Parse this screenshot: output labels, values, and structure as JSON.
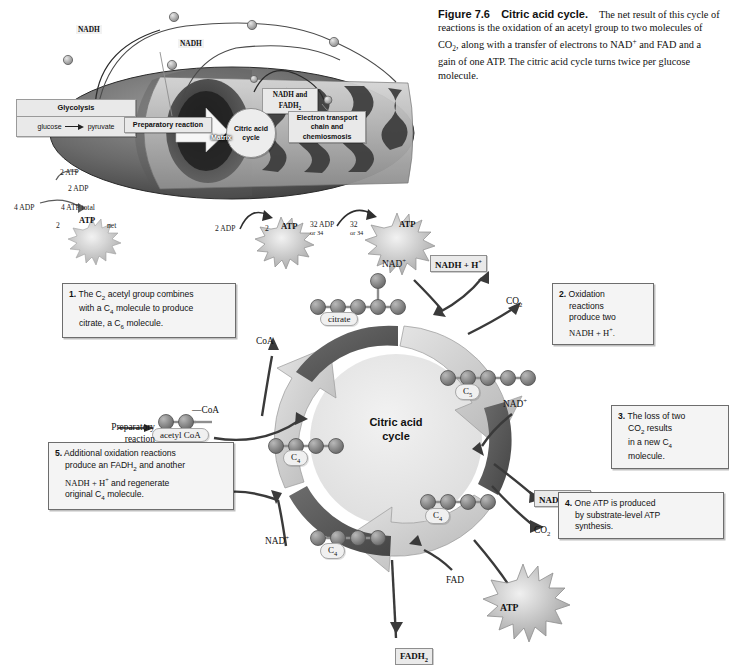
{
  "caption": {
    "figure_number": "Figure 7.6",
    "figure_title": "Citric acid cycle.",
    "body_line1": "The net result of this cycle of",
    "body_line2": "reactions is the oxidation of an acetyl group to two molecules of CO",
    "body_line2_sub": "2",
    "body_line2_end": ",",
    "body_line3a": "along with a transfer of electrons to NAD",
    "body_line3_sup": "+",
    "body_line3b": " and FAD and a gain of one",
    "body_line4": "ATP. The citric acid cycle turns twice per glucose molecule."
  },
  "overview": {
    "glycolysis_title": "Glycolysis",
    "glycolysis_from": "glucose",
    "glycolysis_to": "pyruvate",
    "preparatory_reaction": "Preparatory reaction",
    "citric_acid_cycle": "Citric acid cycle",
    "electron_transport": "Electron transport chain and chemiosmosis",
    "nadh_fadh2_line1": "NADH and",
    "nadh_fadh2_line2": "FADH",
    "nadh_fadh2_sub": "2",
    "matrix": "Matrix",
    "nadh_left": "NADH",
    "nadh_mid": "NADH",
    "atp_2atp": "2 ATP",
    "atp_2adp": "2 ADP",
    "atp_4adp": "4 ADP",
    "atp_4total": "4 ATP total",
    "atp_2": "2",
    "atp_burst": "ATP",
    "atp_net": "net",
    "cac_2adp": "2 ADP",
    "cac_2": "2",
    "cac_atp": "ATP",
    "etc_32adp_l1": "32 ADP",
    "etc_32adp_l2": "or 34",
    "etc_32_l1": "32",
    "etc_32_l2": "or 34",
    "etc_atp": "ATP"
  },
  "cycle": {
    "center_line1": "Citric acid",
    "center_line2": "cycle",
    "preparatory_line1": "Preparatory",
    "preparatory_line2": "reaction",
    "acetyl_coa": "acetyl CoA",
    "coa_bond_label": "CoA",
    "coa_released": "CoA",
    "citrate": "citrate",
    "c5": "C",
    "c5_sub": "5",
    "c4_right": "C",
    "c4_right_sub": "4",
    "c4_bottom": "C",
    "c4_bottom_sub": "4",
    "c4_left": "C",
    "c4_left_sub": "4",
    "nad_top": "NAD",
    "nad_top_sup": "+",
    "nad_right": "NAD",
    "nad_right_sup": "+",
    "nad_bottom": "NAD",
    "nad_bottom_sup": "+",
    "nadh_top": "NADH + H",
    "nadh_top_sup": "+",
    "nadh_right": "NADH + H",
    "nadh_right_sup": "+",
    "nadh_left": "NADH + H",
    "nadh_left_sup": "+",
    "co2_top": "CO",
    "co2_top_sub": "2",
    "co2_right": "CO",
    "co2_right_sub": "2",
    "fad": "FAD",
    "fadh2": "FADH",
    "fadh2_sub": "2",
    "atp": "ATP"
  },
  "steps": [
    {
      "number": "1.",
      "line1_a": "The C",
      "line1_sub": "2",
      "line1_b": " acetyl group combines",
      "line2_a": "with a C",
      "line2_sub": "4",
      "line2_b": " molecule to produce",
      "line3_a": "citrate, a C",
      "line3_sub": "6",
      "line3_b": " molecule."
    },
    {
      "number": "2.",
      "line1": "Oxidation",
      "line2": "reactions",
      "line3": "produce two",
      "line4_a": "NADH + H",
      "line4_sup": "+",
      "line4_b": "."
    },
    {
      "number": "3.",
      "line1": "The loss of two",
      "line2_a": "CO",
      "line2_sub": "2",
      "line2_b": " results",
      "line3_a": "in a new C",
      "line3_sub": "4",
      "line4": "molecule."
    },
    {
      "number": "4.",
      "line1": "One ATP is produced",
      "line2": "by substrate-level ATP",
      "line3": "synthesis."
    },
    {
      "number": "5.",
      "line1": "Additional oxidation reactions",
      "line2_a": "produce an FADH",
      "line2_sub": "2",
      "line2_b": " and another",
      "line3_a": "NADH + H",
      "line3_sup": "+",
      "line3_b": " and regenerate",
      "line4_a": "original C",
      "line4_sub": "4",
      "line4_b": " molecule."
    }
  ],
  "colors": {
    "arrow_dark": "#5a5a5a",
    "arrow_light": "#cfcfcf",
    "cycle_fill": "#e7e7e7",
    "atom": "#7e7e7e",
    "box_bg": "#f4f4f4",
    "tag_bg": "#eaeaea"
  }
}
